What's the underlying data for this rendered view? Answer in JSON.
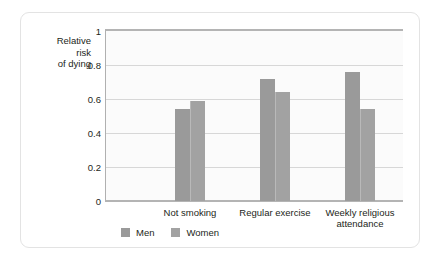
{
  "chart_data": {
    "type": "bar",
    "title": "",
    "xlabel": "",
    "ylabel": "Relative risk of dying",
    "ylabel_lines": [
      "Relative",
      "risk",
      "of dying"
    ],
    "categories": [
      "Not smoking",
      "Regular exercise",
      "Weekly religious attendance"
    ],
    "category_label_lines": [
      [
        "Not smoking"
      ],
      [
        "Regular exercise"
      ],
      [
        "Weekly religious",
        "attendance"
      ]
    ],
    "series": [
      {
        "name": "Men",
        "values": [
          0.54,
          0.72,
          0.76
        ]
      },
      {
        "name": "Women",
        "values": [
          0.59,
          0.64,
          0.54
        ]
      }
    ],
    "ylim": [
      0,
      1
    ],
    "y_ticks": [
      0,
      0.2,
      0.4,
      0.6,
      0.8,
      1
    ],
    "y_tick_labels": [
      "0",
      "0.2",
      "0.4",
      "0.6",
      "0.8",
      "1"
    ],
    "grid": true,
    "grid_axis": "y",
    "legend_position": "bottom-left",
    "colors": {
      "men": "#9a9a9a",
      "women": "#a2a2a2",
      "gridline": "#d7d7d7",
      "axis": "#b4b4b4",
      "plot_background": "#fbfbfb",
      "text": "#231f20",
      "card_border": "#e3e3e3"
    }
  },
  "legend": {
    "items": [
      {
        "label": "Men",
        "swatch_name": "legend-swatch-men"
      },
      {
        "label": "Women",
        "swatch_name": "legend-swatch-women"
      }
    ]
  }
}
